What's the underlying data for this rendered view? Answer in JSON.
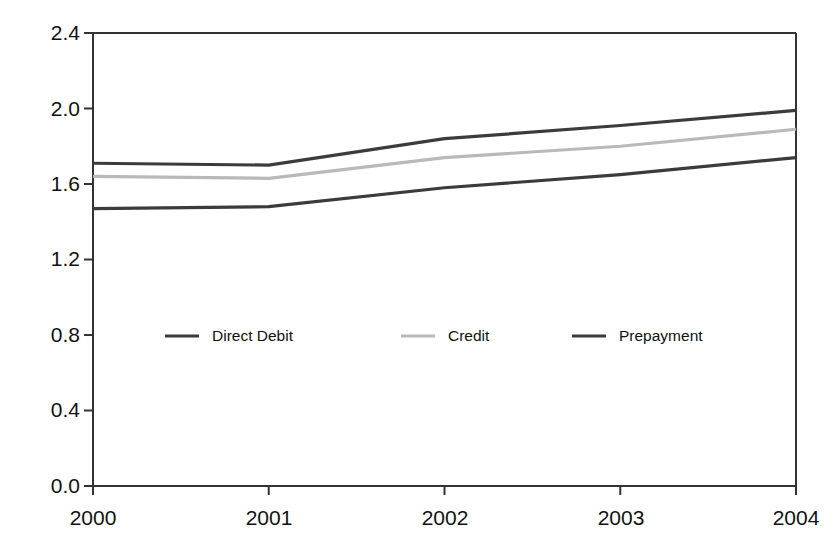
{
  "chart_data": {
    "type": "line",
    "title": "",
    "xlabel": "",
    "ylabel": "Pence/KWh",
    "categories": [
      "2000",
      "2001",
      "2002",
      "2003",
      "2004"
    ],
    "x": [
      2000,
      2001,
      2002,
      2003,
      2004
    ],
    "xlim": [
      2000,
      2004
    ],
    "ylim": [
      0.0,
      2.4
    ],
    "yticks": [
      "0.0",
      "0.4",
      "0.8",
      "1.2",
      "1.6",
      "2.0",
      "2.4"
    ],
    "ytick_values": [
      0.0,
      0.4,
      0.8,
      1.2,
      1.6,
      2.0,
      2.4
    ],
    "grid": false,
    "legend_position": "inside-center-left",
    "series": [
      {
        "name": "Direct Debit",
        "color": "#3b3b3b",
        "values": [
          1.71,
          1.7,
          1.84,
          1.91,
          1.99
        ]
      },
      {
        "name": "Credit",
        "color": "#b9b9b9",
        "values": [
          1.64,
          1.63,
          1.74,
          1.8,
          1.89
        ]
      },
      {
        "name": "Prepayment",
        "color": "#3b3b3b",
        "values": [
          1.47,
          1.48,
          1.58,
          1.65,
          1.74
        ]
      }
    ]
  },
  "axes": {
    "y_title": "Pence/KWh",
    "y_ticks": [
      "2.4",
      "2.0",
      "1.6",
      "1.2",
      "0.8",
      "0.4",
      "0.0"
    ],
    "x_ticks": [
      "2000",
      "2001",
      "2002",
      "2003",
      "2004"
    ],
    "axis_color": "#333333"
  },
  "legend": {
    "items": [
      {
        "label": "Direct Debit",
        "color": "#3b3b3b"
      },
      {
        "label": "Credit",
        "color": "#b9b9b9"
      },
      {
        "label": "Prepayment",
        "color": "#3b3b3b"
      }
    ]
  }
}
